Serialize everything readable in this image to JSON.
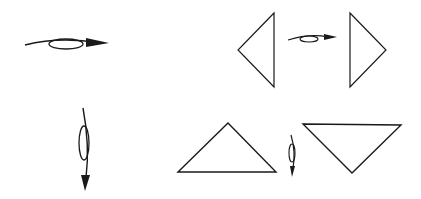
{
  "diagram": {
    "title": "",
    "stroke_color": "#1a1a1a",
    "background": "#ffffff",
    "panels": [
      {
        "name": "rotation-about-vertical-axis",
        "arrow": {
          "direction": "right",
          "from": [
            25,
            42
          ],
          "to": [
            108,
            43
          ],
          "ellipse": {
            "cx": 66,
            "cy": 44,
            "rx": 18,
            "ry": 5
          }
        },
        "before_shape": {
          "type": "triangle",
          "points": [
            [
              274,
              13
            ],
            [
              238,
              50
            ],
            [
              274,
              87
            ]
          ]
        },
        "after_shape": {
          "type": "triangle",
          "points": [
            [
              350,
              13
            ],
            [
              386,
              50
            ],
            [
              350,
              87
            ]
          ]
        },
        "small_arrow": {
          "from": [
            288,
            38
          ],
          "to": [
            336,
            37
          ],
          "ellipse": {
            "cx": 309,
            "cy": 39,
            "rx": 9,
            "ry": 3
          }
        }
      },
      {
        "name": "rotation-about-horizontal-axis",
        "arrow": {
          "direction": "down",
          "from": [
            84,
            108
          ],
          "to": [
            86,
            190
          ],
          "ellipse": {
            "cx": 85,
            "cy": 143,
            "rx": 5,
            "ry": 18
          }
        },
        "before_shape": {
          "type": "triangle",
          "points": [
            [
              178,
              172
            ],
            [
              228,
              123
            ],
            [
              276,
              172
            ]
          ]
        },
        "after_shape": {
          "type": "triangle",
          "points": [
            [
              303,
              124
            ],
            [
              401,
              125
            ],
            [
              352,
              173
            ]
          ]
        },
        "small_arrow": {
          "from": [
            292,
            136
          ],
          "to": [
            293,
            175
          ],
          "ellipse": {
            "cx": 292,
            "cy": 153,
            "rx": 3,
            "ry": 9
          }
        }
      }
    ]
  }
}
